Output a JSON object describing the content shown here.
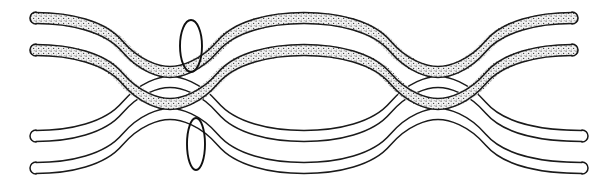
{
  "figure": {
    "type": "line-drawing",
    "width": 616,
    "height": 185,
    "background_color": "#ffffff",
    "stroke_color": "#1a1a1a",
    "fill_plain_color": "#ffffff",
    "fill_stipple_color": "#efefef",
    "stipple_dot_color": "#3a3a3a"
  },
  "bands": [
    {
      "id": "band-1",
      "name": "upper-stippled-yarn-1",
      "style": "stippled",
      "band_width": 11,
      "wave": {
        "left_end_x": 36,
        "right_end_x": 572,
        "baseline_y": 44,
        "amplitude": 26,
        "period": 268,
        "phase": "trough-left"
      },
      "cap": "round"
    },
    {
      "id": "band-2",
      "name": "upper-stippled-yarn-2",
      "style": "stippled",
      "band_width": 11,
      "wave": {
        "left_end_x": 36,
        "right_end_x": 572,
        "baseline_y": 76,
        "amplitude": 26,
        "period": 268,
        "phase": "trough-left"
      },
      "cap": "round"
    },
    {
      "id": "band-3",
      "name": "lower-plain-yarn-1",
      "style": "plain",
      "band_width": 11,
      "wave": {
        "left_end_x": 36,
        "right_end_x": 582,
        "baseline_y": 110,
        "amplitude": 26,
        "period": 268,
        "phase": "crest-left"
      },
      "cap": "round"
    },
    {
      "id": "band-4",
      "name": "lower-plain-yarn-2",
      "style": "plain",
      "band_width": 11,
      "wave": {
        "left_end_x": 36,
        "right_end_x": 582,
        "baseline_y": 142,
        "amplitude": 26,
        "period": 268,
        "phase": "crest-left"
      },
      "cap": "round"
    }
  ],
  "markers": [
    {
      "id": "marker-upper",
      "name": "interlacement-marker-upper",
      "shape": "vertical-ellipse",
      "center_x": 191,
      "center_y": 46,
      "rx": 11,
      "ry": 26
    },
    {
      "id": "marker-lower",
      "name": "interlacement-marker-lower",
      "shape": "vertical-ellipse",
      "center_x": 196,
      "center_y": 144,
      "rx": 9,
      "ry": 26
    }
  ],
  "crossings": [
    {
      "name": "crossing-left",
      "x": 122,
      "y": 98
    },
    {
      "name": "crossing-right",
      "x": 478,
      "y": 98
    }
  ],
  "labels": {
    "none": ""
  }
}
